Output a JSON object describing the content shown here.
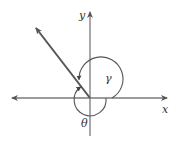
{
  "diagram": {
    "type": "angle-diagram",
    "axes": {
      "x_label": "x",
      "y_label": "y"
    },
    "angles": [
      {
        "symbol": "γ",
        "direction": "counterclockwise",
        "from": "positive x-axis",
        "to": "terminal ray"
      },
      {
        "symbol": "θ",
        "direction": "clockwise",
        "from": "positive x-axis",
        "to": "terminal ray"
      }
    ],
    "terminal_ray": {
      "quadrant": "II"
    },
    "colors": {
      "axis": "#7a7a7a",
      "ray": "#555555",
      "arc": "#555555",
      "text": "#333333"
    }
  }
}
